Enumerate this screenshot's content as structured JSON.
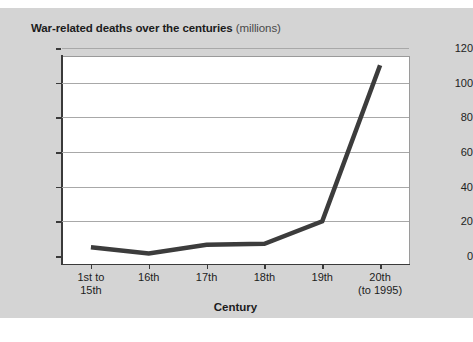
{
  "figure": {
    "title_main": "War-related deaths over the centuries",
    "title_units": "(millions)",
    "panel_color": "#d4d4d4",
    "plot_background": "#ffffff",
    "line_color": "#3c3c3c",
    "gridline_color": "#a8a8a8"
  },
  "chart_data": {
    "type": "line",
    "title": "War-related deaths over the centuries (millions)",
    "xlabel": "Century",
    "ylabel": "",
    "categories": [
      "1st to\n15th",
      "16th",
      "17th",
      "18th",
      "19th",
      "20th\n(to 1995)"
    ],
    "category_lines": [
      [
        "1st to",
        "15th"
      ],
      [
        "16th",
        ""
      ],
      [
        "17th",
        ""
      ],
      [
        "18th",
        ""
      ],
      [
        "19th",
        ""
      ],
      [
        "20th",
        "(to 1995)"
      ]
    ],
    "values": [
      5,
      1.5,
      6.5,
      7,
      20,
      110
    ],
    "ylim": [
      0,
      120
    ],
    "yticks": [
      0,
      20,
      40,
      60,
      80,
      100,
      120
    ],
    "ytick_labels": [
      "0",
      "20",
      "40",
      "60",
      "80",
      "100",
      "120"
    ],
    "grid": true,
    "legend": "none",
    "series": [
      {
        "name": "War-related deaths (millions)",
        "values": [
          5,
          1.5,
          6.5,
          7,
          20,
          110
        ]
      }
    ]
  }
}
